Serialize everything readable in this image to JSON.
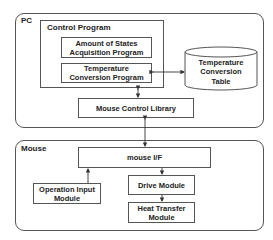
{
  "pc": {
    "label": "PC",
    "control_program": {
      "label": "Control Program",
      "amount_of_states": "Amount of States Acquisition Program",
      "temperature_conversion": "Temperature Conversion Program"
    },
    "table": "Temperature Conversion Table",
    "mouse_control_library": "Mouse Control Library"
  },
  "mouse": {
    "label": "Mouse",
    "interface": "mouse I/F",
    "operation_input": "Operation Input Module",
    "drive": "Drive Module",
    "heat_transfer": "Heat Transfer Module"
  },
  "colors": {
    "stroke": "#555555",
    "text": "#222222",
    "background": "#ffffff"
  }
}
